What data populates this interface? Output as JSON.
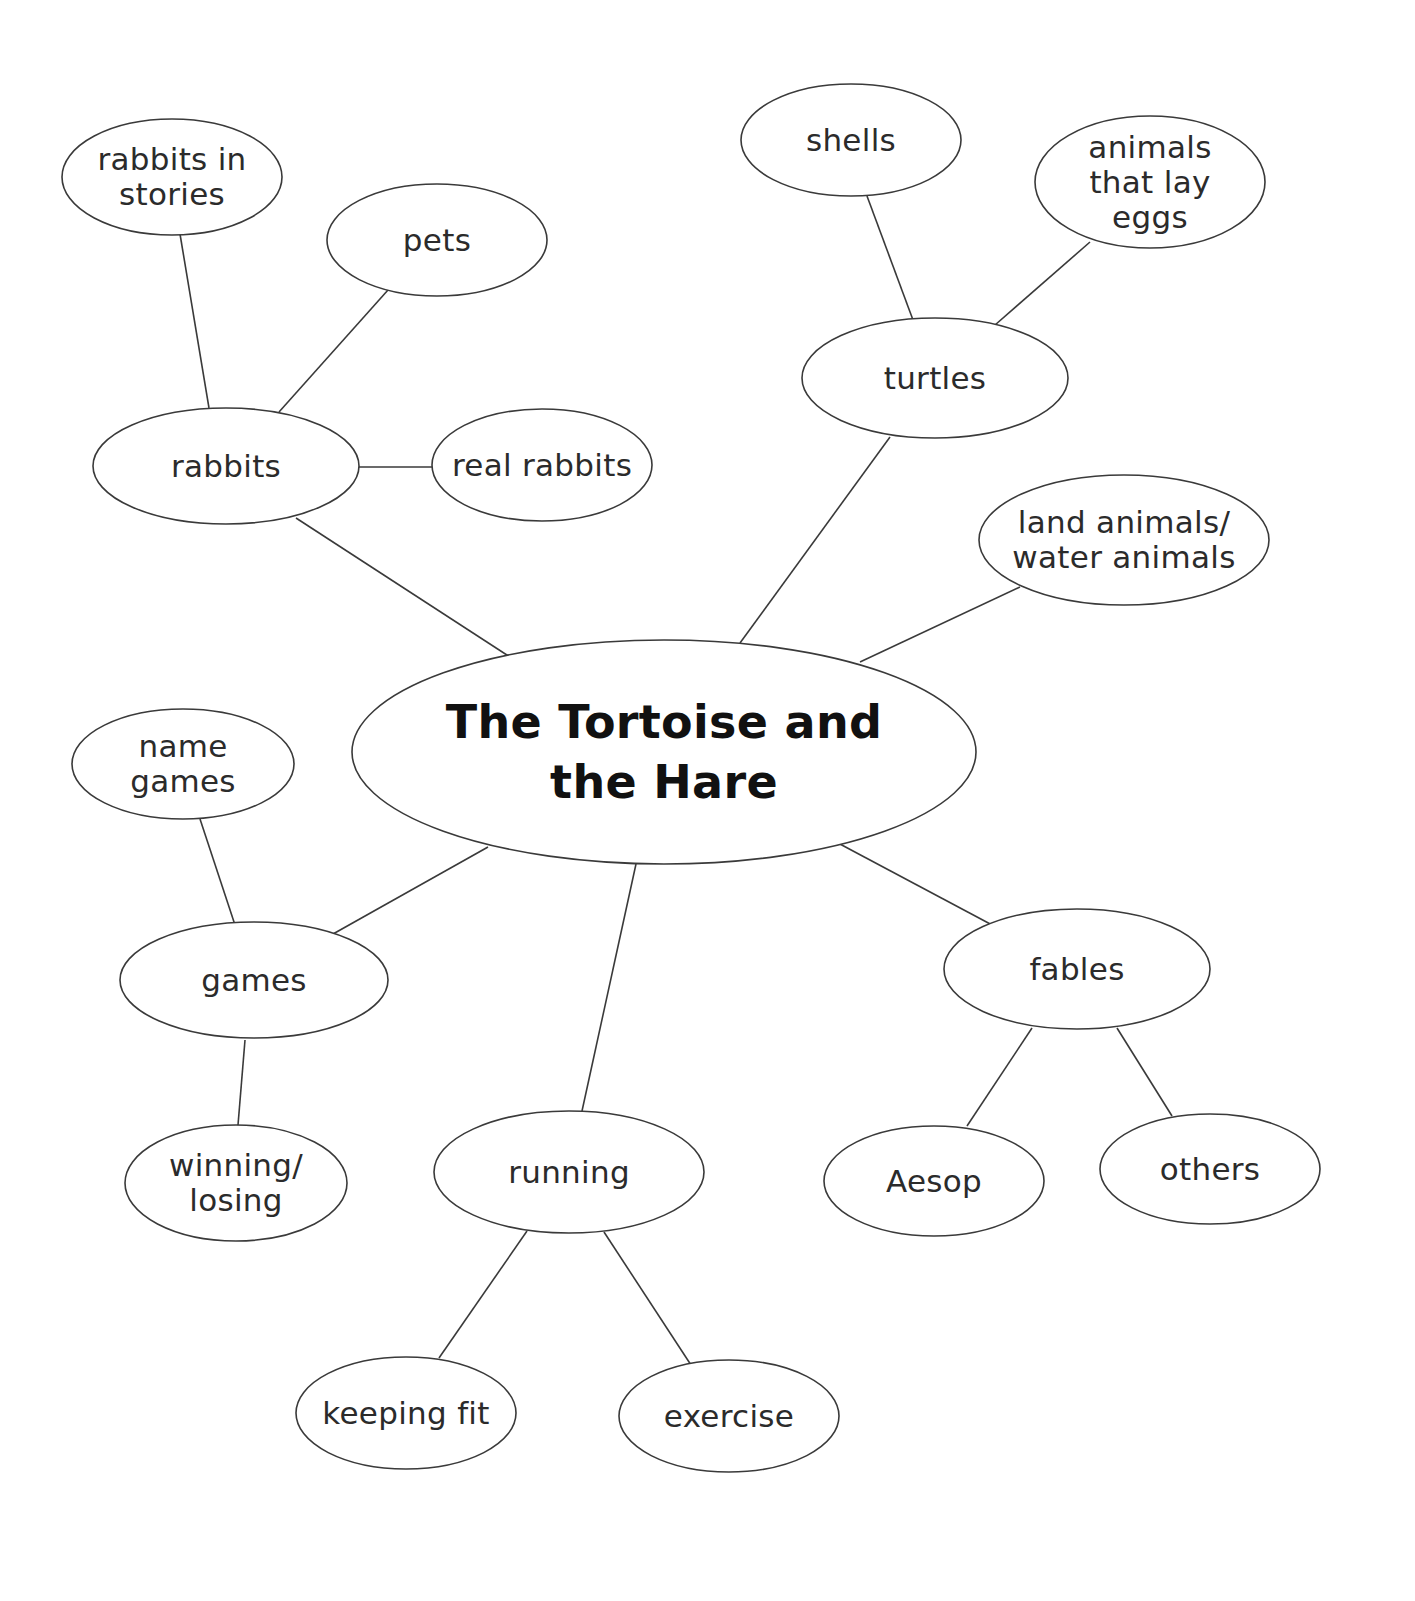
{
  "diagram": {
    "type": "mind-map",
    "colors": {
      "background": "#ffffff",
      "stroke": "#3a3a3a",
      "text": "#2b2b2b",
      "central_text": "#111111"
    },
    "central": {
      "id": "central",
      "lines": [
        "The Tortoise and",
        "the Hare"
      ],
      "cx": 664,
      "cy": 752,
      "rx": 312,
      "ry": 112
    },
    "nodes": [
      {
        "id": "rabbits",
        "lines": [
          "rabbits"
        ],
        "cx": 226,
        "cy": 466,
        "rx": 133,
        "ry": 58
      },
      {
        "id": "rabbits-in-stories",
        "lines": [
          "rabbits in",
          "stories"
        ],
        "cx": 172,
        "cy": 177,
        "rx": 110,
        "ry": 58
      },
      {
        "id": "pets",
        "lines": [
          "pets"
        ],
        "cx": 437,
        "cy": 240,
        "rx": 110,
        "ry": 56
      },
      {
        "id": "real-rabbits",
        "lines": [
          "real rabbits"
        ],
        "cx": 542,
        "cy": 465,
        "rx": 110,
        "ry": 56
      },
      {
        "id": "turtles",
        "lines": [
          "turtles"
        ],
        "cx": 935,
        "cy": 378,
        "rx": 133,
        "ry": 60
      },
      {
        "id": "shells",
        "lines": [
          "shells"
        ],
        "cx": 851,
        "cy": 140,
        "rx": 110,
        "ry": 56
      },
      {
        "id": "animals-that-lay-eggs",
        "lines": [
          "animals",
          "that lay",
          "eggs"
        ],
        "cx": 1150,
        "cy": 182,
        "rx": 115,
        "ry": 66
      },
      {
        "id": "land-water-animals",
        "lines": [
          "land animals/",
          "water animals"
        ],
        "cx": 1124,
        "cy": 540,
        "rx": 145,
        "ry": 65
      },
      {
        "id": "games",
        "lines": [
          "games"
        ],
        "cx": 254,
        "cy": 980,
        "rx": 134,
        "ry": 58
      },
      {
        "id": "name-games",
        "lines": [
          "name",
          "games"
        ],
        "cx": 183,
        "cy": 764,
        "rx": 111,
        "ry": 55
      },
      {
        "id": "winning-losing",
        "lines": [
          "winning/",
          "losing"
        ],
        "cx": 236,
        "cy": 1183,
        "rx": 111,
        "ry": 58
      },
      {
        "id": "running",
        "lines": [
          "running"
        ],
        "cx": 569,
        "cy": 1172,
        "rx": 135,
        "ry": 61
      },
      {
        "id": "keeping-fit",
        "lines": [
          "keeping fit"
        ],
        "cx": 406,
        "cy": 1413,
        "rx": 110,
        "ry": 56
      },
      {
        "id": "exercise",
        "lines": [
          "exercise"
        ],
        "cx": 729,
        "cy": 1416,
        "rx": 110,
        "ry": 56
      },
      {
        "id": "fables",
        "lines": [
          "fables"
        ],
        "cx": 1077,
        "cy": 969,
        "rx": 133,
        "ry": 60
      },
      {
        "id": "aesop",
        "lines": [
          "Aesop"
        ],
        "cx": 934,
        "cy": 1181,
        "rx": 110,
        "ry": 55
      },
      {
        "id": "others",
        "lines": [
          "others"
        ],
        "cx": 1210,
        "cy": 1169,
        "rx": 110,
        "ry": 55
      }
    ],
    "edges": [
      {
        "from": "central",
        "to": "rabbits",
        "x1": 510,
        "y1": 657,
        "x2": 296,
        "y2": 518
      },
      {
        "from": "rabbits",
        "to": "rabbits-in-stories",
        "x1": 209,
        "y1": 408,
        "x2": 180,
        "y2": 234
      },
      {
        "from": "rabbits",
        "to": "pets",
        "x1": 279,
        "y1": 412,
        "x2": 388,
        "y2": 290
      },
      {
        "from": "rabbits",
        "to": "real-rabbits",
        "x1": 359,
        "y1": 467,
        "x2": 432,
        "y2": 467
      },
      {
        "from": "central",
        "to": "turtles",
        "x1": 740,
        "y1": 643,
        "x2": 890,
        "y2": 437
      },
      {
        "from": "turtles",
        "to": "shells",
        "x1": 913,
        "y1": 320,
        "x2": 867,
        "y2": 196
      },
      {
        "from": "turtles",
        "to": "animals-that-lay-eggs",
        "x1": 995,
        "y1": 325,
        "x2": 1090,
        "y2": 242
      },
      {
        "from": "central",
        "to": "land-water-animals",
        "x1": 860,
        "y1": 662,
        "x2": 1020,
        "y2": 587
      },
      {
        "from": "central",
        "to": "games",
        "x1": 488,
        "y1": 847,
        "x2": 333,
        "y2": 934
      },
      {
        "from": "games",
        "to": "name-games",
        "x1": 235,
        "y1": 925,
        "x2": 200,
        "y2": 819
      },
      {
        "from": "games",
        "to": "winning-losing",
        "x1": 245,
        "y1": 1040,
        "x2": 238,
        "y2": 1125
      },
      {
        "from": "central",
        "to": "running",
        "x1": 636,
        "y1": 864,
        "x2": 582,
        "y2": 1111
      },
      {
        "from": "running",
        "to": "keeping-fit",
        "x1": 527,
        "y1": 1231,
        "x2": 439,
        "y2": 1358
      },
      {
        "from": "running",
        "to": "exercise",
        "x1": 604,
        "y1": 1232,
        "x2": 691,
        "y2": 1365
      },
      {
        "from": "central",
        "to": "fables",
        "x1": 838,
        "y1": 843,
        "x2": 994,
        "y2": 926
      },
      {
        "from": "fables",
        "to": "aesop",
        "x1": 1032,
        "y1": 1028,
        "x2": 967,
        "y2": 1126
      },
      {
        "from": "fables",
        "to": "others",
        "x1": 1117,
        "y1": 1028,
        "x2": 1172,
        "y2": 1116
      }
    ]
  }
}
